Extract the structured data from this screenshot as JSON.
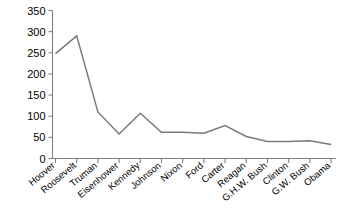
{
  "chart_data": {
    "type": "line",
    "title": "",
    "subtitle": "",
    "xlabel": "",
    "ylabel": "",
    "categories": [
      "Hoover",
      "Roosevelt",
      "Truman",
      "Eisenhower",
      "Kennedy",
      "Johnson",
      "Nixon",
      "Ford",
      "Carter",
      "Reagan",
      "G.H.W. Bush",
      "Clinton",
      "G.W. Bush",
      "Obama"
    ],
    "values": [
      248,
      290,
      110,
      58,
      107,
      62,
      62,
      60,
      78,
      52,
      40,
      40,
      42,
      33
    ],
    "series": [
      {
        "name": "",
        "values": [
          248,
          290,
          110,
          58,
          107,
          62,
          62,
          60,
          78,
          52,
          40,
          40,
          42,
          33
        ]
      }
    ],
    "ylim": [
      0,
      350
    ],
    "ytick_values": [
      0,
      50,
      100,
      150,
      200,
      250,
      300,
      350
    ],
    "ytick_labels": [
      "0",
      "50",
      "100",
      "150",
      "200",
      "250",
      "300",
      "350"
    ],
    "grid": false,
    "legend": false,
    "legend_position": "none",
    "line_color": "#7a7a7a",
    "axis_color": "#808080",
    "text_color": "#000000",
    "background_color": "#ffffff",
    "xtick_label_rotation": -40
  }
}
